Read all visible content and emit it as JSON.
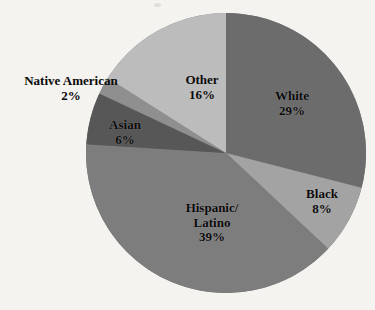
{
  "chart_data": {
    "type": "pie",
    "title": "",
    "subtitle": "",
    "xlabel": "",
    "ylabel": "",
    "legend_position": "none",
    "grid": false,
    "start_angle_deg": 0,
    "direction": "clockwise",
    "categories": [
      "White",
      "Black",
      "Hispanic/Latino",
      "Asian",
      "Native American",
      "Other"
    ],
    "values": [
      29,
      8,
      39,
      6,
      2,
      16
    ],
    "value_unit": "%",
    "slices": [
      {
        "name": "White",
        "label_line1": "White",
        "label_pct": "29%",
        "value": 29,
        "color": "#6c6c6c",
        "label_placement": "inside"
      },
      {
        "name": "Black",
        "label_line1": "Black",
        "label_pct": "8%",
        "value": 8,
        "color": "#a3a3a3",
        "label_placement": "inside"
      },
      {
        "name": "Hispanic/Latino",
        "label_line1": "Hispanic/",
        "label_line2": "Latino",
        "label_pct": "39%",
        "value": 39,
        "color": "#7d7d7d",
        "label_placement": "inside"
      },
      {
        "name": "Asian",
        "label_line1": "Asian",
        "label_pct": "6%",
        "value": 6,
        "color": "#575757",
        "label_placement": "inside"
      },
      {
        "name": "Native American",
        "label_line1": "Native American",
        "label_pct": "2%",
        "value": 2,
        "color": "#8f8f8f",
        "label_placement": "outside-left"
      },
      {
        "name": "Other",
        "label_line1": "Other",
        "label_pct": "16%",
        "value": 16,
        "color": "#bcbcbc",
        "label_placement": "inside"
      }
    ],
    "geometry": {
      "center_x": 226,
      "center_y": 153,
      "radius": 140
    },
    "background_color": "#f4f3f0"
  }
}
